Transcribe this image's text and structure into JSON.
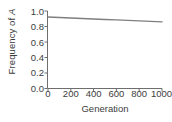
{
  "chart_data": {
    "type": "line",
    "title": "",
    "xlabel": "Generation",
    "ylabel": "Frequency of A",
    "ylabel_parts": {
      "prefix": "Frequency of ",
      "italic": "A"
    },
    "xlim": [
      0,
      1000
    ],
    "ylim": [
      0.0,
      1.0
    ],
    "xticks": [
      0,
      200,
      400,
      600,
      800,
      1000
    ],
    "xticklabels": [
      "0",
      "200",
      "400",
      "600",
      "800",
      "1000"
    ],
    "yticks": [
      0.0,
      0.2,
      0.4,
      0.6,
      0.8,
      1.0
    ],
    "yticklabels": [
      "0.0",
      "0.2",
      "0.4",
      "0.6",
      "0.8",
      "1.0"
    ],
    "grid": false,
    "legend": null,
    "series": [
      {
        "name": "Frequency of A",
        "color": "#7f7f7f",
        "linewidth": 1.4,
        "x": [
          0,
          100,
          200,
          300,
          400,
          500,
          600,
          700,
          800,
          900,
          1000
        ],
        "values": [
          0.922,
          0.916,
          0.91,
          0.903,
          0.897,
          0.891,
          0.885,
          0.879,
          0.873,
          0.866,
          0.86
        ]
      }
    ],
    "axis_color": "#6e6e6e",
    "spines": {
      "left": true,
      "bottom": true,
      "top": false,
      "right": false
    },
    "background": "#ffffff"
  }
}
